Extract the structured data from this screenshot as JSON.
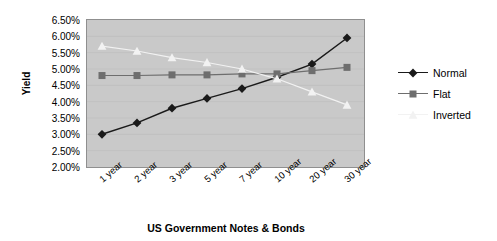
{
  "chart_data": {
    "type": "line",
    "title": "",
    "xlabel": "US Government Notes & Bonds",
    "ylabel": "Yield",
    "categories": [
      "1 year",
      "2 year",
      "3 year",
      "5 year",
      "7 year",
      "10 year",
      "20 year",
      "30 year"
    ],
    "ylim": [
      2.0,
      6.5
    ],
    "ytick_labels": [
      "6.50%",
      "6.00%",
      "5.50%",
      "5.00%",
      "4.50%",
      "4.00%",
      "3.50%",
      "3.00%",
      "2.50%",
      "2.00%"
    ],
    "ytick_values": [
      6.5,
      6.0,
      5.5,
      5.0,
      4.5,
      4.0,
      3.5,
      3.0,
      2.5,
      2.0
    ],
    "grid": true,
    "legend_position": "right",
    "plot_background": "#c9c9c9",
    "series": [
      {
        "name": "Normal",
        "color": "#1a1a1a",
        "marker": "diamond",
        "values": [
          3.0,
          3.35,
          3.8,
          4.1,
          4.4,
          4.75,
          5.15,
          5.95
        ]
      },
      {
        "name": "Flat",
        "color": "#6e6e6e",
        "marker": "square",
        "values": [
          4.8,
          4.8,
          4.82,
          4.82,
          4.85,
          4.85,
          4.95,
          5.05
        ]
      },
      {
        "name": "Inverted",
        "color": "#f2f2f2",
        "marker": "triangle",
        "values": [
          5.7,
          5.55,
          5.35,
          5.2,
          5.0,
          4.7,
          4.3,
          3.9
        ]
      }
    ]
  },
  "legend": {
    "items": [
      {
        "label": "Normal"
      },
      {
        "label": "Flat"
      },
      {
        "label": "Inverted"
      }
    ]
  }
}
